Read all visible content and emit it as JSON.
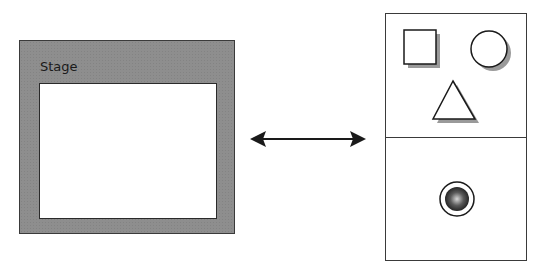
{
  "diagram": {
    "stage": {
      "label": "Stage",
      "frame_color": "#8e8e8e",
      "canvas_color": "#ffffff"
    },
    "connector": {
      "type": "double-headed-arrow",
      "color": "#1a1a1a"
    },
    "library_panel": {
      "sections": [
        {
          "name": "shapes",
          "items": [
            {
              "shape": "square",
              "icon": "square-icon"
            },
            {
              "shape": "circle",
              "icon": "circle-icon"
            },
            {
              "shape": "triangle",
              "icon": "triangle-icon"
            }
          ]
        },
        {
          "name": "components",
          "items": [
            {
              "shape": "radio-button",
              "icon": "radio-button-icon"
            }
          ]
        }
      ],
      "shadow_color": "#9a9a9a"
    }
  }
}
